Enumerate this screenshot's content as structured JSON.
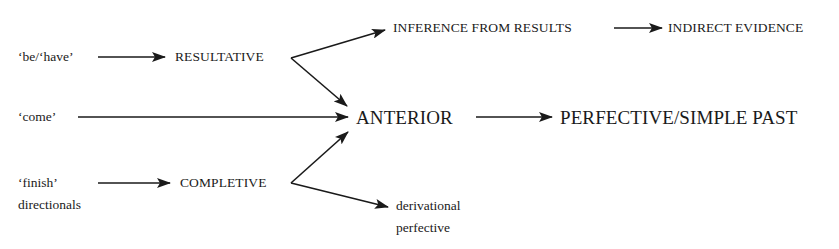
{
  "diagram": {
    "type": "grammaticalization-pathway",
    "nodes": {
      "be_have": "‘be/‘have’",
      "come": "‘come’",
      "finish": "‘finish’",
      "directionals": "directionals",
      "resultative": "RESULTATIVE",
      "completive": "COMPLETIVE",
      "inference": "INFERENCE FROM RESULTS",
      "indirect": "INDIRECT EVIDENCE",
      "anterior": "ANTERIOR",
      "perfective_past": "PERFECTIVE/SIMPLE PAST",
      "derivational_1": "derivational",
      "derivational_2": "perfective"
    },
    "edges": [
      {
        "from": "‘be/‘have’",
        "to": "RESULTATIVE"
      },
      {
        "from": "RESULTATIVE",
        "to": "INFERENCE FROM RESULTS"
      },
      {
        "from": "INFERENCE FROM RESULTS",
        "to": "INDIRECT EVIDENCE"
      },
      {
        "from": "RESULTATIVE",
        "to": "ANTERIOR"
      },
      {
        "from": "‘come’",
        "to": "ANTERIOR"
      },
      {
        "from": "‘finish’ / directionals",
        "to": "COMPLETIVE"
      },
      {
        "from": "COMPLETIVE",
        "to": "ANTERIOR"
      },
      {
        "from": "COMPLETIVE",
        "to": "derivational perfective"
      },
      {
        "from": "ANTERIOR",
        "to": "PERFECTIVE/SIMPLE PAST"
      }
    ],
    "colors": {
      "ink": "#1a1a1a",
      "background": "#ffffff"
    }
  }
}
